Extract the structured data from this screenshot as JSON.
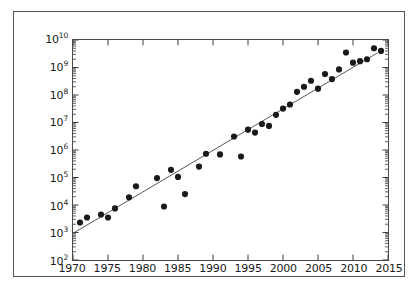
{
  "chart_data": {
    "type": "scatter",
    "title": "",
    "xlabel": "",
    "ylabel": "",
    "xlim": [
      1970,
      2015
    ],
    "ylim": [
      100,
      10000000000
    ],
    "yscale": "log",
    "xscale": "linear",
    "grid": false,
    "legend": null,
    "xticks": [
      1970,
      1975,
      1980,
      1985,
      1990,
      1995,
      2000,
      2005,
      2010,
      2015
    ],
    "xtick_labels": [
      "1970",
      "1975",
      "1980",
      "1985",
      "1990",
      "1995",
      "2000",
      "2005",
      "2010",
      "2015"
    ],
    "yticks": [
      100,
      1000,
      10000,
      100000,
      1000000,
      10000000,
      100000000,
      1000000000,
      10000000000
    ],
    "ytick_labels": [
      "10^2",
      "10^3",
      "10^4",
      "10^5",
      "10^6",
      "10^7",
      "10^8",
      "10^9",
      "10^10"
    ],
    "ytick_mantissa": [
      "10",
      "10",
      "10",
      "10",
      "10",
      "10",
      "10",
      "10",
      "10"
    ],
    "ytick_exponents": [
      "2",
      "3",
      "4",
      "5",
      "6",
      "7",
      "8",
      "9",
      "10"
    ],
    "minor_ticks": true,
    "marker": "circle",
    "marker_color": "#1a1a1a",
    "marker_size": 6.2,
    "line_color": "#555555",
    "line_width": 1.0,
    "series": [
      {
        "name": "data-points",
        "x": [
          1971,
          1972,
          1974,
          1975,
          1976,
          1978,
          1979,
          1982,
          1983,
          1984,
          1985,
          1986,
          1988,
          1989,
          1991,
          1993,
          1994,
          1995,
          1996,
          1997,
          1998,
          1999,
          2000,
          2001,
          2002,
          2003,
          2004,
          2005,
          2006,
          2007,
          2008,
          2009,
          2010,
          2011,
          2012,
          2013,
          2014
        ],
        "y": [
          2300,
          3500,
          4500,
          3500,
          7500,
          19000,
          48000,
          95000,
          8800,
          190000,
          105000,
          25000,
          250000,
          730000,
          690000,
          3100000,
          580000,
          5500000,
          4300000,
          8800000,
          7500000,
          19000000,
          32000000,
          45000000,
          130000000,
          200000000,
          330000000,
          170000000,
          580000000,
          380000000,
          850000000,
          3500000000,
          1500000000,
          1700000000,
          2000000000,
          5000000000,
          4000000000
        ]
      }
    ],
    "trend_line": {
      "name": "fit-line",
      "x": [
        1970.2,
        2013.5
      ],
      "y": [
        1000,
        3400000000
      ]
    }
  }
}
